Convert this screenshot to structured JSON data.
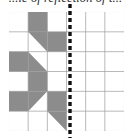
{
  "caption": {
    "text": "...le of reflection of t..."
  },
  "figure": {
    "type": "grid-reflection-diagram",
    "grid": {
      "columns": 6,
      "rows": 6,
      "cell_size_px": 19.17,
      "origin_x_px": 9,
      "origin_y_px": 12,
      "line_color": "#9a9a9a",
      "border_color": "#8f8f8f",
      "background_color": "#ffffff"
    },
    "shape": {
      "fill_color": "#8c8c8c",
      "description": "shaded arrow-like polygon occupying the left three columns",
      "cells": [
        {
          "col": 2,
          "row": 1,
          "fill": "full"
        },
        {
          "col": 2,
          "row": 2,
          "fill": "upper-right-triangle"
        },
        {
          "col": 3,
          "row": 2,
          "fill": "full"
        },
        {
          "col": 1,
          "row": 3,
          "fill": "full"
        },
        {
          "col": 2,
          "row": 3,
          "fill": "lower-right-triangle"
        },
        {
          "col": 2,
          "row": 4,
          "fill": "full"
        },
        {
          "col": 1,
          "row": 5,
          "fill": "full"
        },
        {
          "col": 2,
          "row": 5,
          "fill": "upper-right-triangle"
        },
        {
          "col": 3,
          "row": 5,
          "fill": "full"
        },
        {
          "col": 3,
          "row": 6,
          "fill": "upper-right-triangle"
        }
      ],
      "polygon_points_cells": "2,0 3,0 3,1 4,1 4,2 3,2 3,3 2,3 2,4 3,4 3,5 2,5 1,5 1,4 2,4 2,3 1,3 1,2 2,2 2,1"
    },
    "mirror_line": {
      "label": "mirror-line",
      "orientation": "vertical",
      "style": "dashed",
      "color": "#111111",
      "x_px": 70,
      "at_grid_column": 3,
      "dash_length_px": 4,
      "gap_length_px": 3,
      "thickness_px": 3.4,
      "extends_beyond_grid": true
    }
  }
}
